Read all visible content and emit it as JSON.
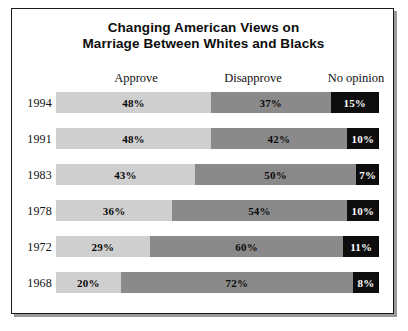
{
  "chart_data": {
    "type": "bar",
    "subtype": "stacked-horizontal-100",
    "title": "Changing American Views on Marriage Between Whites and Blacks",
    "title_lines": [
      "Changing American Views on",
      "Marriage Between Whites and Blacks"
    ],
    "xlabel": "",
    "ylabel": "",
    "xlim": [
      0,
      100
    ],
    "grid": false,
    "legend_position": "top-as-column-headers",
    "categories": [
      "1994",
      "1991",
      "1983",
      "1978",
      "1972",
      "1968"
    ],
    "series": [
      {
        "name": "Approve",
        "values": [
          48,
          48,
          43,
          36,
          29,
          20
        ],
        "color": "#cfcfcf"
      },
      {
        "name": "Disapprove",
        "values": [
          37,
          42,
          50,
          54,
          60,
          72
        ],
        "color": "#8a8a8a"
      },
      {
        "name": "No opinion",
        "values": [
          15,
          10,
          7,
          10,
          11,
          8
        ],
        "color": "#0d0d0d"
      }
    ],
    "value_labels": [
      [
        "48%",
        "37%",
        "15%"
      ],
      [
        "48%",
        "42%",
        "10%"
      ],
      [
        "43%",
        "50%",
        "7%"
      ],
      [
        "36%",
        "54%",
        "10%"
      ],
      [
        "29%",
        "60%",
        "11%"
      ],
      [
        "20%",
        "72%",
        "8%"
      ]
    ],
    "rows": [
      {
        "year": "1994",
        "approve": 48,
        "disapprove": 37,
        "no_opinion": 15,
        "approve_label": "48%",
        "disapprove_label": "37%",
        "no_opinion_label": "15%"
      },
      {
        "year": "1991",
        "approve": 48,
        "disapprove": 42,
        "no_opinion": 10,
        "approve_label": "48%",
        "disapprove_label": "42%",
        "no_opinion_label": "10%"
      },
      {
        "year": "1983",
        "approve": 43,
        "disapprove": 50,
        "no_opinion": 7,
        "approve_label": "43%",
        "disapprove_label": "50%",
        "no_opinion_label": "7%"
      },
      {
        "year": "1978",
        "approve": 36,
        "disapprove": 54,
        "no_opinion": 10,
        "approve_label": "36%",
        "disapprove_label": "54%",
        "no_opinion_label": "10%"
      },
      {
        "year": "1972",
        "approve": 29,
        "disapprove": 60,
        "no_opinion": 11,
        "approve_label": "29%",
        "disapprove_label": "60%",
        "no_opinion_label": "11%"
      },
      {
        "year": "1968",
        "approve": 20,
        "disapprove": 72,
        "no_opinion": 8,
        "approve_label": "20%",
        "disapprove_label": "72%",
        "no_opinion_label": "8%"
      }
    ],
    "column_headers": [
      "Approve",
      "Disapprove",
      "No opinion"
    ]
  },
  "headers": {
    "approve": "Approve",
    "disapprove": "Disapprove",
    "no_opinion": "No opinion"
  },
  "colors": {
    "approve": "#cfcfcf",
    "disapprove": "#8a8a8a",
    "no_opinion": "#0d0d0d",
    "frame_border": "#1a1a1a",
    "text": "#0d0d0d",
    "background": "#ffffff"
  }
}
